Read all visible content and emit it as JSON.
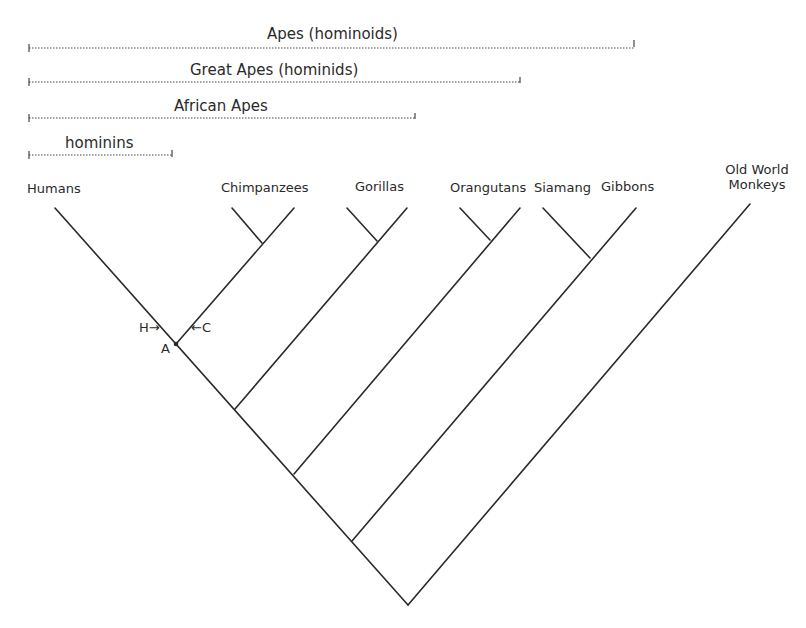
{
  "groups": [
    {
      "label": "Apes (hominoids)",
      "x1": 29,
      "x2": 634,
      "y": 44
    },
    {
      "label": "Great Apes (hominids)",
      "x1": 29,
      "x2": 520,
      "y": 81
    },
    {
      "label": "African Apes",
      "x1": 29,
      "x2": 415,
      "y": 117
    },
    {
      "label": "hominins",
      "x1": 29,
      "x2": 172,
      "y": 154
    }
  ],
  "taxa": {
    "humans": "Humans",
    "chimpanzees": "Chimpanzees",
    "gorillas": "Gorillas",
    "orangutans": "Orangutans",
    "siamang": "Siamang",
    "gibbons": "Gibbons",
    "owm_line1": "Old World",
    "owm_line2": "Monkeys"
  },
  "annotations": {
    "h_arrow": "H→",
    "c_arrow": "←C",
    "a_node": "A"
  },
  "colors": {
    "line": "#2a2a2a",
    "background": "#ffffff"
  }
}
